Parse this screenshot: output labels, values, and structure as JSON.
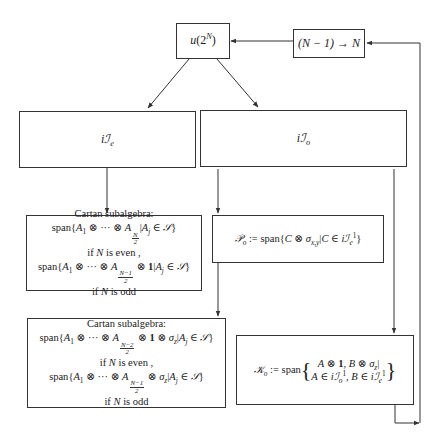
{
  "nodes": {
    "u2n": {
      "label": "u(2^N)"
    },
    "shift": {
      "label": "(N − 1) → N"
    },
    "ie": {
      "label": "iℐ_e"
    },
    "io": {
      "label": "iℐ_o"
    },
    "cartan_even_branch": {
      "title": "Cartan subalgebra:",
      "line1": "span{A₁ ⊗ ··· ⊗ A_{N/2} | A_j ∈ 𝒮}",
      "cond1": "if N is even ,",
      "line2": "span{A₁ ⊗ ··· ⊗ A_{(N−1)/2} ⊗ 1 | A_j ∈ 𝒮}",
      "cond2": "if N is odd"
    },
    "p_o": {
      "label": "𝒫_o := span{C ⊗ σ_{x,y} | C ∈ iℐ_e^1}"
    },
    "cartan_odd_branch": {
      "title": "Cartan subalgebra:",
      "line1": "span{A₁ ⊗ ··· ⊗ A_{(N−2)/2} ⊗ 1 ⊗ σ_z | A_j ∈ 𝒮}",
      "cond1": "if N is even ,",
      "line2": "span{A₁ ⊗ ··· ⊗ A_{(N−1)/2} ⊗ σ_z | A_j ∈ 𝒮}",
      "cond2": "if N is odd"
    },
    "k_o": {
      "label": "𝒦_o := span",
      "row1": "A ⊗ 1, B ⊗ σ_z |",
      "row2": "A ∈ iℐ_o^1, B ∈ iℐ_e^1"
    }
  },
  "text": {
    "cartan_title": "Cartan subalgebra:",
    "even": "if N is even ,",
    "odd": "if N is odd",
    "span": "span",
    "u": "u",
    "two": "2",
    "N": "N",
    "shift_text": "(N − 1) → N",
    "i": "i",
    "I": "ℐ",
    "e": "e",
    "o": "o",
    "P": "𝒫",
    "K": "𝒦",
    "S": "𝒮",
    "defeq": ":=",
    "one": "1"
  }
}
